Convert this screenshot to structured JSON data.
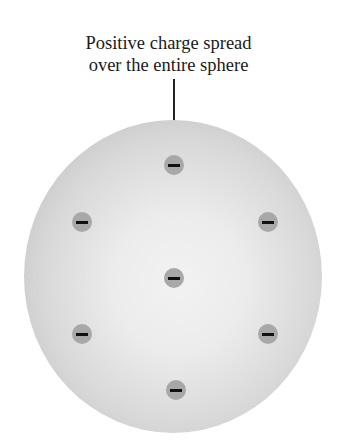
{
  "diagram": {
    "label_line1": "Positive charge spread",
    "label_line2": "over the entire sphere",
    "sphere": {
      "description": "positively charged sphere",
      "color": "#d8d8d8"
    },
    "electrons": [
      {
        "charge": "−",
        "x": 174,
        "y": 165
      },
      {
        "charge": "−",
        "x": 82,
        "y": 222
      },
      {
        "charge": "−",
        "x": 268,
        "y": 222
      },
      {
        "charge": "−",
        "x": 174,
        "y": 278
      },
      {
        "charge": "−",
        "x": 82,
        "y": 334
      },
      {
        "charge": "−",
        "x": 268,
        "y": 334
      },
      {
        "charge": "−",
        "x": 176,
        "y": 390
      }
    ]
  }
}
